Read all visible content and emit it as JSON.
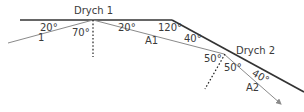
{
  "diagram": {
    "mirrors": [
      {
        "label": "Drych 1"
      },
      {
        "label": "Drych 2"
      }
    ],
    "rays": [
      {
        "label": "1"
      },
      {
        "label": "A1"
      },
      {
        "label": "A2"
      }
    ],
    "angles": {
      "incident_m1": "20°",
      "normal_m1": "70°",
      "reflected_m1": "20°",
      "mirror_bend": "120°",
      "incident_m2_mirror": "40°",
      "normal_m2_in": "50°",
      "normal_m2_out": "50°",
      "reflected_m2": "40°"
    },
    "colors": {
      "mirror": "#333333",
      "ray": "#8a8a8a",
      "normal": "#222222",
      "text": "#3a3a3a"
    }
  }
}
